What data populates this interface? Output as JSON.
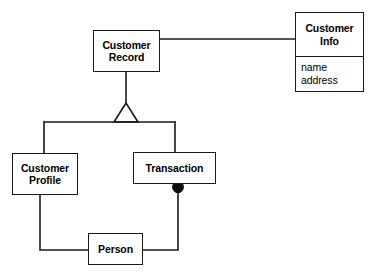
{
  "diagram": {
    "kind": "uml-class-diagram",
    "background_color": "#ffffff",
    "line_color": "#1a1a1a",
    "text_color": "#000000",
    "nodes": {
      "customer_record": {
        "label": "Customer\nRecord",
        "x": 93,
        "y": 30,
        "w": 67,
        "h": 42
      },
      "customer_info": {
        "label": "Customer\nInfo",
        "attributes": [
          "name",
          "address"
        ],
        "x": 295,
        "y": 12,
        "w": 69,
        "h": 80
      },
      "customer_profile": {
        "label": "Customer\nProfile",
        "x": 12,
        "y": 153,
        "w": 66,
        "h": 42
      },
      "transaction": {
        "label": "Transaction",
        "x": 133,
        "y": 152,
        "w": 83,
        "h": 32
      },
      "person": {
        "label": "Person",
        "x": 88,
        "y": 233,
        "w": 55,
        "h": 32
      }
    },
    "connectors": [
      {
        "name": "customer-record-to-customer-info",
        "type": "association",
        "from": "customer_record",
        "to": "customer_info"
      },
      {
        "name": "generalization-customer-record",
        "type": "generalization",
        "from": "customer_record",
        "to": [
          "customer_profile",
          "transaction"
        ],
        "marker": "hollow-triangle"
      },
      {
        "name": "transaction-to-person",
        "type": "composition",
        "from": "transaction",
        "to": "person",
        "marker": "filled-diamond"
      },
      {
        "name": "customer-profile-to-person",
        "type": "association",
        "from": "customer_profile",
        "to": "person"
      }
    ]
  }
}
